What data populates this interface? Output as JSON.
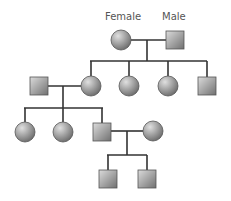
{
  "diagram": {
    "type": "pedigree-chart",
    "labels": {
      "female": "Female",
      "male": "Male"
    },
    "colors": {
      "line": "#333333",
      "shape_light": "#d9d9d9",
      "shape_dark": "#6e6e6e",
      "stroke": "#444444",
      "label": "#555555"
    },
    "generations": [
      {
        "name": "generation-1",
        "members": [
          {
            "id": "g1-female",
            "sex": "female",
            "label": "Female"
          },
          {
            "id": "g1-male",
            "sex": "male",
            "label": "Male"
          }
        ]
      },
      {
        "name": "generation-2",
        "members": [
          {
            "id": "g2-spouse-male",
            "sex": "male"
          },
          {
            "id": "g2-daughter-1",
            "sex": "female"
          },
          {
            "id": "g2-daughter-2",
            "sex": "female"
          },
          {
            "id": "g2-daughter-3",
            "sex": "female"
          },
          {
            "id": "g2-son-1",
            "sex": "male"
          }
        ]
      },
      {
        "name": "generation-3",
        "members": [
          {
            "id": "g3-daughter-1",
            "sex": "female"
          },
          {
            "id": "g3-daughter-2",
            "sex": "female"
          },
          {
            "id": "g3-son-1",
            "sex": "male"
          },
          {
            "id": "g3-spouse-female",
            "sex": "female"
          }
        ]
      },
      {
        "name": "generation-4",
        "members": [
          {
            "id": "g4-son-1",
            "sex": "male"
          },
          {
            "id": "g4-son-2",
            "sex": "male"
          }
        ]
      }
    ]
  }
}
